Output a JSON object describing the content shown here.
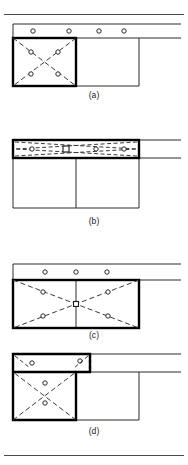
{
  "figure": {
    "width": 188,
    "height": 465,
    "background": "#ffffff",
    "line_color": "#2b2b2b",
    "bold_line_color": "#000000",
    "dash_color": "#3a3a3a",
    "rule_color": "#4a4a4a"
  },
  "captions": {
    "a": "(a)",
    "b": "(b)",
    "c": "(c)",
    "d": "(d)"
  },
  "geometry": {
    "frame_left": 13,
    "frame_mid": 76,
    "frame_right": 139,
    "beam_right_end": 181,
    "bay_width": 63,
    "beam_depth": 14,
    "bay_height": 48,
    "node_radius": 2.2,
    "thin_stroke": 1,
    "bold_stroke": 2.4,
    "dash_pattern": "5,3"
  },
  "panels": [
    {
      "id": "a",
      "caption": "(a)",
      "description": "Top beam with four connector circles; bold-outlined left bay containing dashed X-bracing with four circles",
      "top_beam_nodes": 4,
      "braced_bay": "left",
      "bold_region": "left-bay",
      "brace_nodes": 4,
      "brace_type": "dashed-X"
    },
    {
      "id": "b",
      "caption": "(b)",
      "description": "Bold-outlined flattened top beam substructure spanning both bays with circles and collapsed dashed bracing; plain open bays below",
      "top_beam_nodes": 4,
      "braced_bay": "beam",
      "bold_region": "top-beam",
      "brace_nodes": 4,
      "brace_type": "flattened-dashed-X"
    },
    {
      "id": "c",
      "caption": "(c)",
      "description": "Top beam with three circles; bold-outlined full-width bay spanning both bays with dashed X-bracing crossing at center and four circles",
      "top_beam_nodes": 3,
      "braced_bay": "both",
      "bold_region": "full-width-bay",
      "brace_nodes": 4,
      "brace_type": "dashed-X"
    },
    {
      "id": "d",
      "caption": "(d)",
      "description": "Bold-outlined L-shaped region covering the left top beam segment and the left bay, with dashed bracing and circles in both",
      "top_beam_nodes": 2,
      "braced_bay": "left-plus-beam",
      "bold_region": "L-shape",
      "brace_nodes": 2,
      "brace_type": "dashed-X"
    }
  ],
  "footer": {
    "rule_present": true
  }
}
